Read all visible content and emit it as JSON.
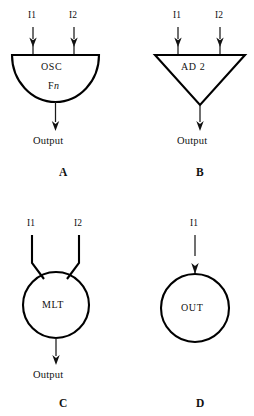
{
  "diagram": {
    "background_color": "#ffffff",
    "ink_color": "#000000",
    "panels": [
      {
        "id": "A",
        "letter": "A",
        "shape": "semicircle",
        "block_label": "OSC",
        "block_sublabel_prefix": "F",
        "block_sublabel_italic": "n",
        "inputs": [
          "I1",
          "I2"
        ],
        "output": "Output",
        "input_arrowheads": true,
        "output_arrowhead": true
      },
      {
        "id": "B",
        "letter": "B",
        "shape": "inverted-triangle",
        "block_label": "AD 2",
        "inputs": [
          "I1",
          "I2"
        ],
        "output": "Output",
        "input_arrowheads": true,
        "output_arrowhead": true
      },
      {
        "id": "C",
        "letter": "C",
        "shape": "circle",
        "block_label": "MLT",
        "inputs": [
          "I1",
          "I2"
        ],
        "output": "Output",
        "input_arrowheads": false,
        "output_arrowhead": true
      },
      {
        "id": "D",
        "letter": "D",
        "shape": "circle",
        "block_label": "OUT",
        "inputs": [
          "I1"
        ],
        "output": null,
        "input_arrowheads": true,
        "output_arrowhead": false
      }
    ]
  }
}
